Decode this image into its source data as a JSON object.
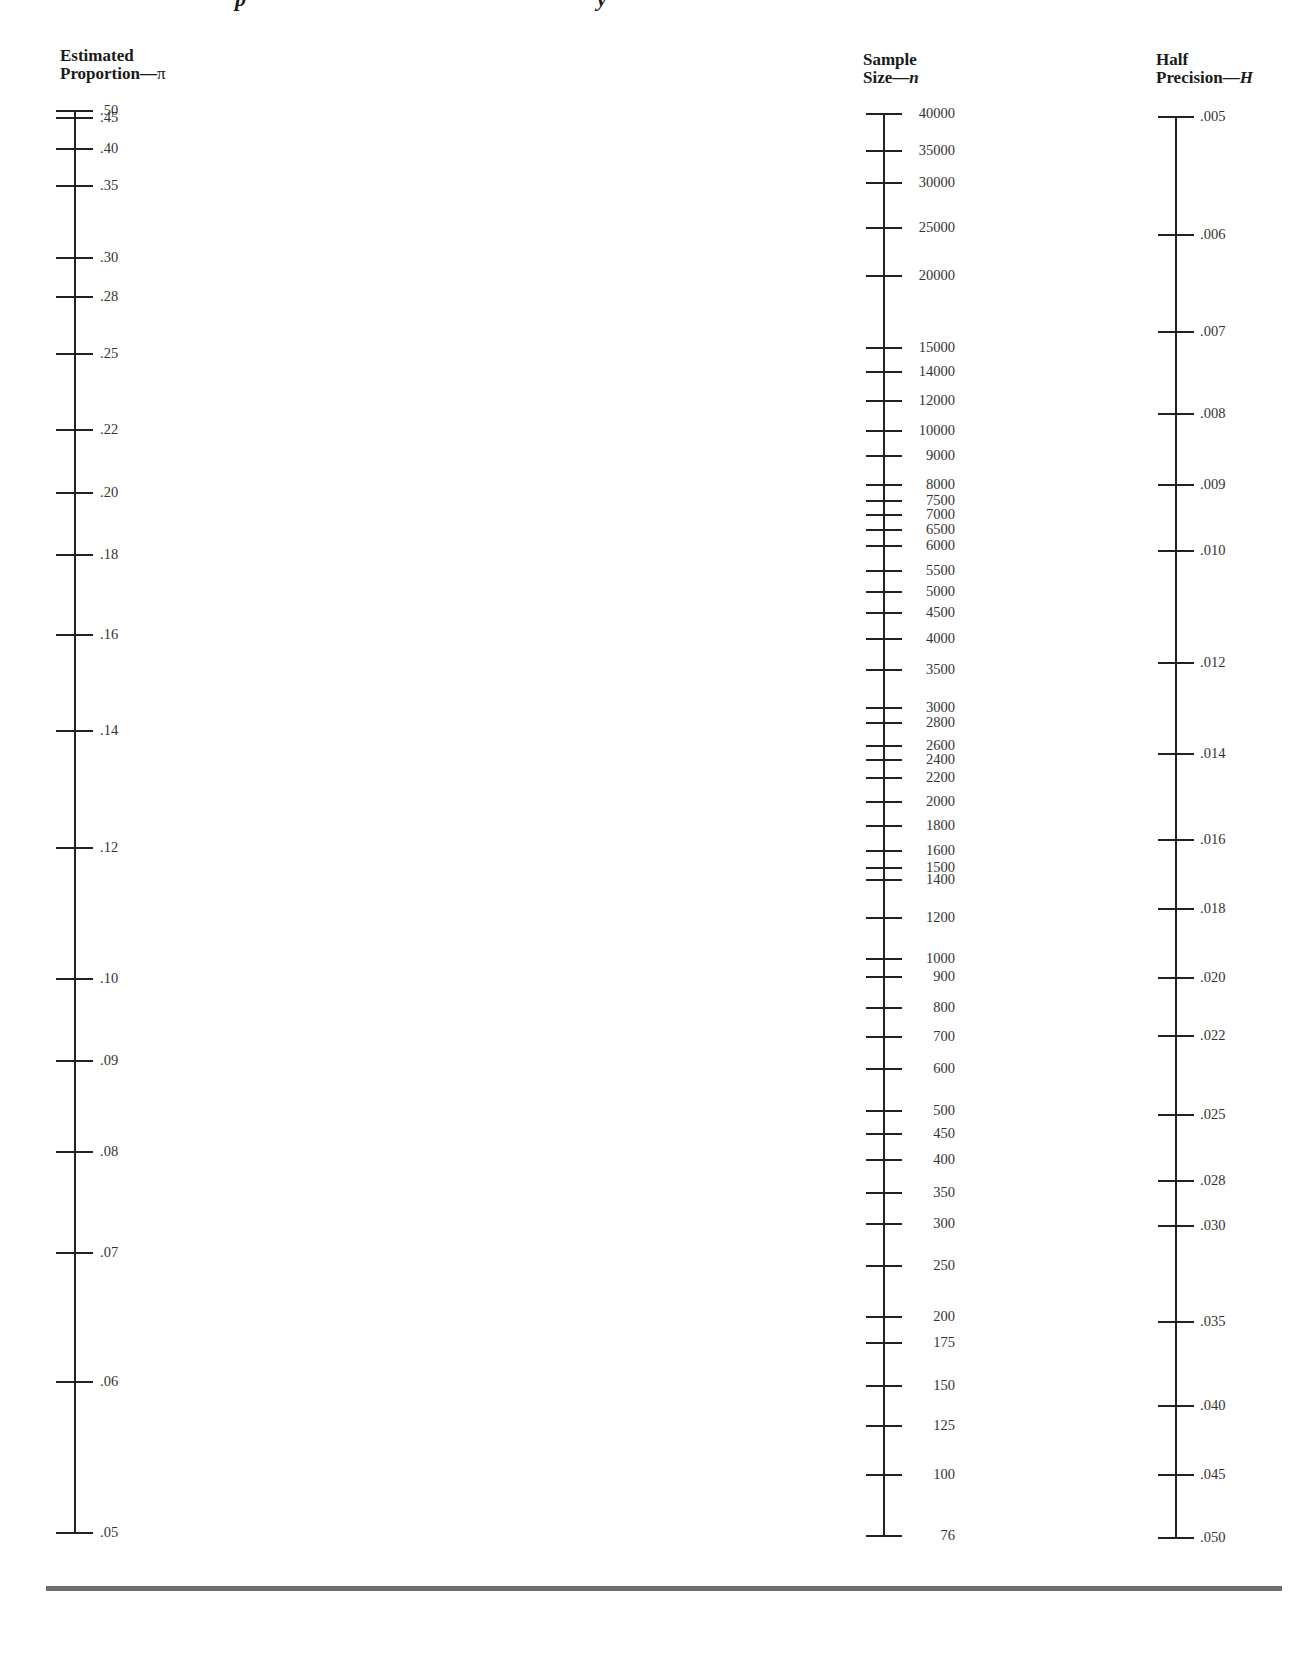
{
  "page": {
    "title_fragment": "p                                               y",
    "bottom_rule": true
  },
  "chart_data": {
    "type": "nomogram",
    "title": "",
    "axes": [
      {
        "id": "proportion",
        "label_line1": "Estimated",
        "label_line2": "Proportion—",
        "symbol": "π",
        "scale": "nonlinear",
        "range": [
          0.05,
          0.5
        ],
        "ticks": [
          ".50",
          ".45",
          ".40",
          ".35",
          ".30",
          ".28",
          ".25",
          ".22",
          ".20",
          ".18",
          ".16",
          ".14",
          ".12",
          ".10",
          ".09",
          ".08",
          ".07",
          ".06",
          ".05"
        ],
        "values": [
          0.5,
          0.45,
          0.4,
          0.35,
          0.3,
          0.28,
          0.25,
          0.22,
          0.2,
          0.18,
          0.16,
          0.14,
          0.12,
          0.1,
          0.09,
          0.08,
          0.07,
          0.06,
          0.05
        ]
      },
      {
        "id": "sample_size",
        "label_line1": "Sample",
        "label_line2": "Size—",
        "symbol": "n",
        "scale": "log",
        "range": [
          76,
          40000
        ],
        "ticks": [
          "40000",
          "35000",
          "30000",
          "25000",
          "20000",
          "15000",
          "14000",
          "12000",
          "10000",
          "9000",
          "8000",
          "7500",
          "7000",
          "6500",
          "6000",
          "5500",
          "5000",
          "4500",
          "4000",
          "3500",
          "3000",
          "2800",
          "2600",
          "2400",
          "2200",
          "2000",
          "1800",
          "1600",
          "1500",
          "1400",
          "1200",
          "1000",
          "900",
          "800",
          "700",
          "600",
          "500",
          "450",
          "400",
          "350",
          "300",
          "250",
          "200",
          "175",
          "150",
          "125",
          "100",
          "76"
        ],
        "values": [
          40000,
          35000,
          30000,
          25000,
          20000,
          15000,
          14000,
          12000,
          10000,
          9000,
          8000,
          7500,
          7000,
          6500,
          6000,
          5500,
          5000,
          4500,
          4000,
          3500,
          3000,
          2800,
          2600,
          2400,
          2200,
          2000,
          1800,
          1600,
          1500,
          1400,
          1200,
          1000,
          900,
          800,
          700,
          600,
          500,
          450,
          400,
          350,
          300,
          250,
          200,
          175,
          150,
          125,
          100,
          76
        ]
      },
      {
        "id": "half_precision",
        "label_line1": "Half",
        "label_line2": "Precision—",
        "symbol": "H",
        "scale": "log",
        "range": [
          0.005,
          0.05
        ],
        "ticks": [
          ".005",
          ".006",
          ".007",
          ".008",
          ".009",
          ".010",
          ".012",
          ".014",
          ".016",
          ".018",
          ".020",
          ".022",
          ".025",
          ".028",
          ".030",
          ".035",
          ".040",
          ".045",
          ".050"
        ],
        "values": [
          0.005,
          0.006,
          0.007,
          0.008,
          0.009,
          0.01,
          0.012,
          0.014,
          0.016,
          0.018,
          0.02,
          0.022,
          0.025,
          0.028,
          0.03,
          0.035,
          0.04,
          0.045,
          0.05
        ]
      }
    ],
    "grid": false,
    "legend": null
  },
  "layout_positions": {
    "proportion": [
      111,
      118,
      149,
      186,
      258,
      297,
      354,
      430,
      493,
      555,
      635,
      731,
      848,
      979,
      1061,
      1152,
      1253,
      1382,
      1533
    ],
    "sample_size": [
      114,
      151,
      183,
      228,
      276,
      348,
      372,
      401,
      431,
      456,
      485,
      501,
      515,
      530,
      546,
      571,
      592,
      613,
      639,
      670,
      708,
      723,
      746,
      760,
      778,
      802,
      826,
      851,
      868,
      880,
      918,
      959,
      977,
      1008,
      1037,
      1069,
      1111,
      1134,
      1160,
      1193,
      1224,
      1266,
      1317,
      1343,
      1386,
      1426,
      1475,
      1536
    ],
    "half_precision": [
      117,
      235,
      332,
      414,
      485,
      551,
      663,
      754,
      840,
      909,
      978,
      1036,
      1115,
      1181,
      1226,
      1322,
      1406,
      1475,
      1538
    ]
  }
}
